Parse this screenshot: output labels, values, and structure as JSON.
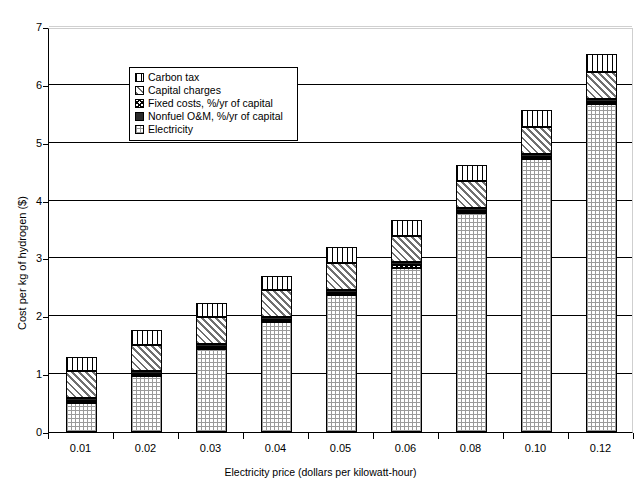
{
  "chart_data": {
    "type": "bar",
    "stacked": true,
    "title": "",
    "xlabel": "Electricity price (dollars per kilowatt-hour)",
    "ylabel": "Cost per kg of hydrogen ($)",
    "categories": [
      "0.01",
      "0.02",
      "0.03",
      "0.04",
      "0.05",
      "0.06",
      "0.08",
      "0.10",
      "0.12"
    ],
    "ylim": [
      0,
      7
    ],
    "yticks": [
      0,
      1,
      2,
      3,
      4,
      5,
      6,
      7
    ],
    "ytick_labels": [
      "0",
      "1",
      "2",
      "3",
      "4",
      "5",
      "6",
      "7"
    ],
    "grid": true,
    "legend_position": "upper-left-inside",
    "series": [
      {
        "name": "Electricity",
        "values": [
          0.5,
          0.96,
          1.43,
          1.9,
          2.37,
          2.84,
          3.78,
          4.72,
          5.67
        ]
      },
      {
        "name": "Fixed costs, %/yr of capital",
        "values": [
          0.04,
          0.04,
          0.04,
          0.04,
          0.04,
          0.04,
          0.04,
          0.04,
          0.04
        ]
      },
      {
        "name": "Nonfuel O&M, %/yr of capital",
        "values": [
          0.05,
          0.05,
          0.05,
          0.05,
          0.05,
          0.05,
          0.05,
          0.05,
          0.05
        ]
      },
      {
        "name": "Capital charges",
        "values": [
          0.46,
          0.46,
          0.46,
          0.46,
          0.46,
          0.46,
          0.46,
          0.46,
          0.46
        ]
      },
      {
        "name": "Carbon tax",
        "values": [
          0.25,
          0.25,
          0.25,
          0.25,
          0.28,
          0.28,
          0.29,
          0.3,
          0.31
        ]
      }
    ],
    "totals": [
      1.3,
      1.76,
      2.23,
      2.7,
      3.2,
      3.67,
      4.62,
      5.57,
      6.53
    ]
  },
  "legend": {
    "items": [
      {
        "label": "Carbon tax",
        "pattern": "carbon"
      },
      {
        "label": "Capital charges",
        "pattern": "capital"
      },
      {
        "label": "Fixed costs, %/yr of capital",
        "pattern": "fixed"
      },
      {
        "label": "Nonfuel O&M, %/yr of capital",
        "pattern": "nonfuel"
      },
      {
        "label": "Electricity",
        "pattern": "electricity"
      }
    ]
  },
  "colors": {
    "axis": "#000000",
    "gridline": "#000000",
    "plot_background": "#ffffff"
  }
}
